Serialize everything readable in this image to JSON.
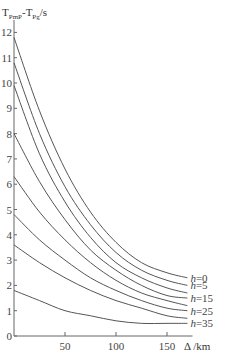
{
  "chart_data": {
    "type": "line",
    "title": "",
    "ylabel": "T_PmP - T_Pg / s",
    "ylabel_main": "T",
    "ylabel_sub1": "PmP",
    "ylabel_mid": "-T",
    "ylabel_sub2": "Pg",
    "ylabel_unit": "/s",
    "xlabel": "Δ /km",
    "xlim": [
      0,
      175
    ],
    "ylim": [
      0,
      12.5
    ],
    "xticks": [
      50,
      100,
      150
    ],
    "yticks": [
      0,
      1,
      2,
      3,
      4,
      5,
      6,
      7,
      8,
      9,
      10,
      11,
      12
    ],
    "grid": false,
    "x": [
      0,
      25,
      50,
      75,
      100,
      125,
      150,
      170
    ],
    "series": [
      {
        "name": "h=0",
        "label": "h=0",
        "values": [
          11.8,
          8.9,
          6.6,
          4.9,
          3.7,
          2.9,
          2.5,
          2.3
        ]
      },
      {
        "name": "h=5",
        "label": "h=5",
        "values": [
          10.8,
          8.0,
          5.9,
          4.4,
          3.3,
          2.6,
          2.2,
          2.0
        ]
      },
      {
        "name": "h=10",
        "label": "",
        "values": [
          9.9,
          7.2,
          5.3,
          3.9,
          2.9,
          2.3,
          1.9,
          1.7
        ]
      },
      {
        "name": "h=15",
        "label": "h=15",
        "values": [
          8.0,
          6.1,
          4.6,
          3.4,
          2.6,
          2.0,
          1.6,
          1.5
        ]
      },
      {
        "name": "h=20",
        "label": "",
        "values": [
          6.3,
          4.9,
          3.8,
          2.9,
          2.2,
          1.7,
          1.4,
          1.2
        ]
      },
      {
        "name": "h=25",
        "label": "h=25",
        "values": [
          4.8,
          3.8,
          3.0,
          2.3,
          1.8,
          1.4,
          1.1,
          1.0
        ]
      },
      {
        "name": "h=30",
        "label": "",
        "values": [
          3.6,
          2.9,
          2.3,
          1.8,
          1.4,
          1.1,
          0.8,
          0.7
        ]
      },
      {
        "name": "h=35",
        "label": "h=35",
        "values": [
          1.8,
          1.4,
          1.0,
          0.8,
          0.6,
          0.5,
          0.5,
          0.5
        ]
      }
    ],
    "legend": "inline labels at right end of curves"
  },
  "colors": {
    "line": "#555555",
    "axis": "#666666",
    "text": "#333333"
  }
}
